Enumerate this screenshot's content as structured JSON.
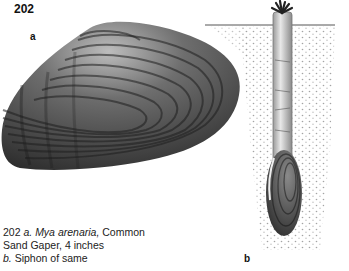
{
  "plate": {
    "number": "202",
    "labels": {
      "a": "a",
      "b": "b"
    }
  },
  "caption": {
    "line1_prefix": "202 ",
    "line1_a": "a.",
    "line1_species": "Mya arenaria,",
    "line1_suffix": " Common",
    "line2": "Sand Gaper, 4 inches",
    "line3_b": "b.",
    "line3_text": " Siphon of same"
  },
  "illustrations": [
    {
      "id": "a",
      "subject": "clam shell (Mya arenaria)"
    },
    {
      "id": "b",
      "subject": "clam buried in sand with extended siphon"
    }
  ],
  "colors": {
    "background": "#ffffff",
    "shell_dark": "#2b2b2b",
    "shell_mid": "#6a6a6a",
    "sand_dots": "#9a9a9a"
  }
}
